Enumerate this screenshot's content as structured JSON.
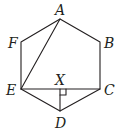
{
  "diagram": {
    "type": "regular hexagon with diagonals",
    "vertices": {
      "A": {
        "label": "A",
        "x": 60,
        "y": 19
      },
      "B": {
        "label": "B",
        "x": 100,
        "y": 42
      },
      "C": {
        "label": "C",
        "x": 100,
        "y": 89
      },
      "D": {
        "label": "D",
        "x": 60,
        "y": 111
      },
      "E": {
        "label": "E",
        "x": 21,
        "y": 89
      },
      "F": {
        "label": "F",
        "x": 21,
        "y": 42
      },
      "X": {
        "label": "X",
        "x": 60,
        "y": 89
      }
    },
    "segments": [
      "AB",
      "BC",
      "CD",
      "DE",
      "EF",
      "FA",
      "AE",
      "EC",
      "XD"
    ],
    "right_angle_marker": {
      "at": "X",
      "between": [
        "XC",
        "XD"
      ]
    },
    "colors": {
      "stroke": "#231f20",
      "text": "#231f20",
      "background": "#ffffff"
    }
  }
}
